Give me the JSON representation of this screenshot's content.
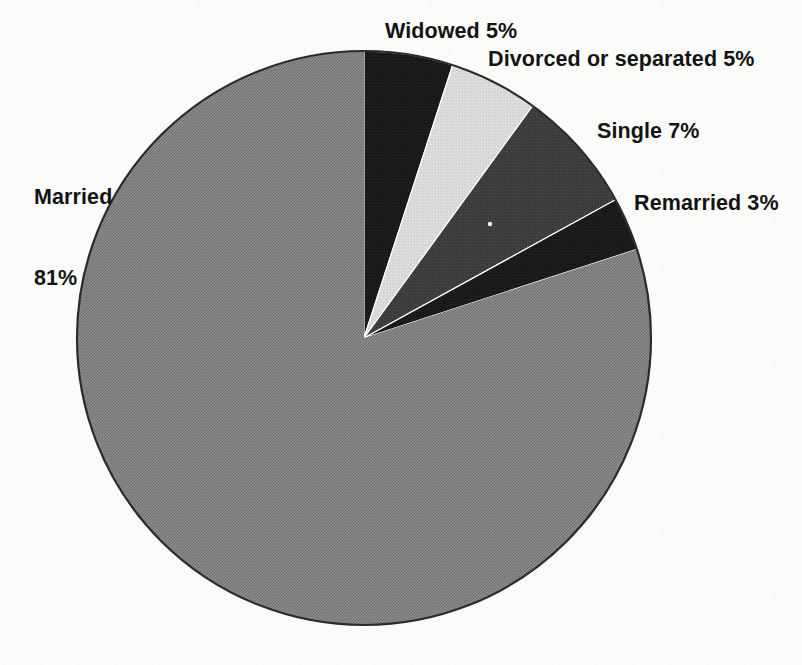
{
  "chart_data": {
    "type": "pie",
    "title": "",
    "subtitle": "",
    "xlabel": "",
    "ylabel": "",
    "legend_position": "none",
    "grid": false,
    "units": "%",
    "start_angle_deg": 0,
    "direction": "clockwise",
    "categories": [
      "Widowed",
      "Divorced or separated",
      "Single",
      "Remarried",
      "Married"
    ],
    "values": [
      5,
      5,
      7,
      3,
      81
    ],
    "slices": [
      {
        "name": "Widowed",
        "value": 5,
        "label": "Widowed 5%",
        "color": "#1c1c1c",
        "start_deg": 0,
        "end_deg": 18
      },
      {
        "name": "Divorced or separated",
        "value": 5,
        "label": "Divorced or separated 5%",
        "color": "#d9d9d9",
        "start_deg": 18,
        "end_deg": 36
      },
      {
        "name": "Single",
        "value": 7,
        "label": "Single 7%",
        "color": "#3d3d3d",
        "start_deg": 36,
        "end_deg": 61.2
      },
      {
        "name": "Remarried",
        "value": 3,
        "label": "Remarried 3%",
        "color": "#1c1c1c",
        "start_deg": 61.2,
        "end_deg": 72
      },
      {
        "name": "Married",
        "value": 81,
        "label": "Married\n81%",
        "label_line1": "Married",
        "label_line2": "81%",
        "color": "#7e7e7e",
        "start_deg": 72,
        "end_deg": 360
      }
    ],
    "geometry": {
      "center_x": 364,
      "center_y": 338,
      "radius": 287
    },
    "outline_color": "#2b2b2b",
    "background_color": "#fbfbfa"
  },
  "labels": {
    "widowed": "Widowed 5%",
    "divorced": "Divorced or separated 5%",
    "single": "Single 7%",
    "remarried": "Remarried 3%",
    "married_line1": "Married",
    "married_line2": "81%"
  }
}
